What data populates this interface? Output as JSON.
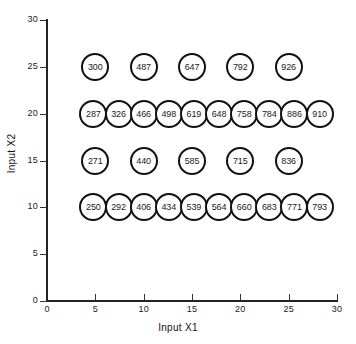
{
  "chart_data": {
    "type": "scatter",
    "title": "",
    "xlabel": "Input X1",
    "ylabel": "Input X2",
    "xlim": [
      0,
      30
    ],
    "ylim": [
      0,
      30
    ],
    "xticks": [
      0,
      5,
      10,
      15,
      20,
      25,
      30
    ],
    "yticks": [
      0,
      5,
      10,
      15,
      20,
      25,
      30
    ],
    "grid": false,
    "legend": false,
    "point_style": "open-circle-with-value-label",
    "series": [
      {
        "name": "row-x2-25",
        "points": [
          {
            "x": 5,
            "y": 25,
            "label": "300"
          },
          {
            "x": 10,
            "y": 25,
            "label": "487"
          },
          {
            "x": 15,
            "y": 25,
            "label": "647"
          },
          {
            "x": 20,
            "y": 25,
            "label": "792"
          },
          {
            "x": 25,
            "y": 25,
            "label": "926"
          }
        ]
      },
      {
        "name": "row-x2-20",
        "points": [
          {
            "x": 4.8,
            "y": 20,
            "label": "287"
          },
          {
            "x": 7.4,
            "y": 20,
            "label": "326"
          },
          {
            "x": 10.0,
            "y": 20,
            "label": "466"
          },
          {
            "x": 12.6,
            "y": 20,
            "label": "498"
          },
          {
            "x": 15.2,
            "y": 20,
            "label": "619"
          },
          {
            "x": 17.8,
            "y": 20,
            "label": "648"
          },
          {
            "x": 20.4,
            "y": 20,
            "label": "758"
          },
          {
            "x": 23.0,
            "y": 20,
            "label": "784"
          },
          {
            "x": 25.6,
            "y": 20,
            "label": "886"
          },
          {
            "x": 28.2,
            "y": 20,
            "label": "910"
          }
        ]
      },
      {
        "name": "row-x2-15",
        "points": [
          {
            "x": 5,
            "y": 15,
            "label": "271"
          },
          {
            "x": 10,
            "y": 15,
            "label": "440"
          },
          {
            "x": 15,
            "y": 15,
            "label": "585"
          },
          {
            "x": 20,
            "y": 15,
            "label": "715"
          },
          {
            "x": 25,
            "y": 15,
            "label": "836"
          }
        ]
      },
      {
        "name": "row-x2-10",
        "points": [
          {
            "x": 4.8,
            "y": 10,
            "label": "250"
          },
          {
            "x": 7.4,
            "y": 10,
            "label": "292"
          },
          {
            "x": 10.0,
            "y": 10,
            "label": "406"
          },
          {
            "x": 12.6,
            "y": 10,
            "label": "434"
          },
          {
            "x": 15.2,
            "y": 10,
            "label": "539"
          },
          {
            "x": 17.8,
            "y": 10,
            "label": "564"
          },
          {
            "x": 20.4,
            "y": 10,
            "label": "660"
          },
          {
            "x": 23.0,
            "y": 10,
            "label": "683"
          },
          {
            "x": 25.6,
            "y": 10,
            "label": "771"
          },
          {
            "x": 28.2,
            "y": 10,
            "label": "793"
          }
        ]
      }
    ],
    "colors": {
      "axis": "#222222",
      "point_stroke": "#111111",
      "point_fill": "#ffffff",
      "text": "#1a1a1a"
    }
  },
  "geometry": {
    "x0_px": 47,
    "x30_px": 337,
    "y0_px": 301,
    "y30_px": 20
  }
}
